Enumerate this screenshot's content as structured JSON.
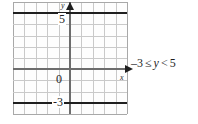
{
  "figure": {
    "type": "coordinate-grid"
  },
  "axes": {
    "y_axis_label": "y",
    "x_axis_label": "x",
    "origin_label": "0",
    "y_ticks": [
      "5",
      "-3"
    ],
    "x_range": [
      -5,
      5
    ],
    "y_range": [
      -4,
      6
    ],
    "grid": "on",
    "grid_step": 1
  },
  "boundaries": [
    {
      "name": "upper-bound",
      "value": 5,
      "style": "solid-dark",
      "meaning": "y < 5"
    },
    {
      "name": "lower-bound",
      "value": -3,
      "style": "solid-dark",
      "meaning": "-3 <= y"
    }
  ],
  "annotation": {
    "inequality": "–3 ≤ y < 5",
    "lower": "–3",
    "lower_operator": "≤",
    "variable": "y",
    "upper_operator": "<",
    "upper": "5"
  },
  "colors": {
    "background": "#ffffff",
    "grid": "#c9c9c9",
    "frame": "#a8a8a8",
    "axis": "#6d6d6d",
    "boundary": "#1f1f1f",
    "text": "#1f1f1f"
  },
  "chart_data": {
    "type": "line",
    "title": "",
    "xlabel": "x",
    "ylabel": "y",
    "xlim": [
      -5,
      5
    ],
    "ylim": [
      -4,
      6
    ],
    "grid": true,
    "legend": "none",
    "series": [
      {
        "name": "y = 5 (upper boundary, strict)",
        "type": "horizontal-line",
        "y": 5,
        "values": [
          5,
          5
        ]
      },
      {
        "name": "y = -3 (lower boundary, inclusive)",
        "type": "horizontal-line",
        "y": -3,
        "values": [
          -3,
          -3
        ]
      }
    ],
    "xticks": [
      -5,
      -4,
      -3,
      -2,
      -1,
      0,
      1,
      2,
      3,
      4,
      5
    ],
    "yticks": [
      -4,
      -3,
      -2,
      -1,
      0,
      1,
      2,
      3,
      4,
      5,
      6
    ],
    "tick_labels_shown": {
      "x": [
        "0"
      ],
      "y": [
        "5",
        "-3"
      ]
    },
    "annotations": [
      {
        "text": "–3 ≤ y < 5",
        "x": 5.6,
        "y": 0.2
      }
    ]
  }
}
